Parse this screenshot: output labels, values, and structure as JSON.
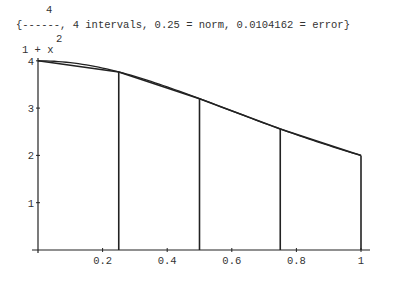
{
  "header": {
    "numerator": "4",
    "fraction_line": "{------, 4 intervals, 0.25 = norm, 0.0104162 = error}",
    "exponent": "2",
    "denominator": "1 + x"
  },
  "chart_data": {
    "type": "line",
    "function": "4/(1+x^2)",
    "intervals": 4,
    "norm": 0.25,
    "error": 0.0104162,
    "xlabel": "",
    "ylabel": "",
    "xlim": [
      0,
      1
    ],
    "ylim": [
      0,
      4
    ],
    "grid": false,
    "x_ticks": [
      0.2,
      0.4,
      0.6,
      0.8,
      1
    ],
    "x_tick_labels": [
      "0.2",
      "0.4",
      "0.6",
      "0.8",
      "1"
    ],
    "y_ticks": [
      1,
      2,
      3,
      4
    ],
    "y_tick_labels": [
      "1",
      "2",
      "3",
      "4"
    ],
    "series": [
      {
        "name": "curve 4/(1+x^2)",
        "x": [
          0,
          0.125,
          0.25,
          0.375,
          0.5,
          0.625,
          0.75,
          0.875,
          1
        ],
        "y": [
          4,
          3.9385,
          3.7647,
          3.5068,
          3.2,
          2.8764,
          2.56,
          2.2663,
          2
        ]
      },
      {
        "name": "trapezoid partition",
        "x": [
          0,
          0.25,
          0.5,
          0.75,
          1
        ],
        "y": [
          4,
          3.7647,
          3.2,
          2.56,
          2
        ]
      }
    ]
  }
}
